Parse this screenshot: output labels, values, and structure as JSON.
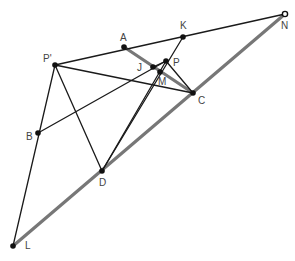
{
  "diagram": {
    "type": "geometry-construction",
    "colors": {
      "thin_line": "#1a1a1a",
      "thick_line": "#777777",
      "point": "#111111",
      "label": "#444444"
    },
    "points": [
      {
        "id": "A",
        "label": "A",
        "x": 124,
        "y": 47,
        "lx": 120,
        "ly": 41
      },
      {
        "id": "K",
        "label": "K",
        "x": 183,
        "y": 37,
        "lx": 180,
        "ly": 29
      },
      {
        "id": "N",
        "label": "N",
        "x": 285,
        "y": 14,
        "lx": 281,
        "ly": 29
      },
      {
        "id": "P'",
        "label": "P'",
        "x": 55,
        "y": 65,
        "lx": 43,
        "ly": 62
      },
      {
        "id": "J",
        "label": "J",
        "x": 153,
        "y": 67,
        "lx": 137,
        "ly": 71
      },
      {
        "id": "P",
        "label": "P",
        "x": 166,
        "y": 61,
        "lx": 173,
        "ly": 66
      },
      {
        "id": "M",
        "label": "M",
        "x": 160,
        "y": 72,
        "lx": 158,
        "ly": 85
      },
      {
        "id": "C",
        "label": "C",
        "x": 193,
        "y": 93,
        "lx": 198,
        "ly": 104
      },
      {
        "id": "B",
        "label": "B",
        "x": 38,
        "y": 133,
        "lx": 26,
        "ly": 140
      },
      {
        "id": "D",
        "label": "D",
        "x": 102,
        "y": 171,
        "lx": 99,
        "ly": 186
      },
      {
        "id": "L",
        "label": "L",
        "x": 13,
        "y": 246,
        "lx": 25,
        "ly": 249
      }
    ],
    "segments": [
      {
        "from": "L",
        "to": "N",
        "style": "thick"
      },
      {
        "from": "A",
        "to": "C",
        "style": "thick"
      },
      {
        "from": "P'",
        "to": "N",
        "style": "thin"
      },
      {
        "from": "P'",
        "to": "L",
        "style": "thin"
      },
      {
        "from": "P'",
        "to": "C",
        "style": "thin"
      },
      {
        "from": "P'",
        "to": "D",
        "style": "thin"
      },
      {
        "from": "B",
        "to": "P",
        "style": "thin"
      },
      {
        "from": "D",
        "to": "K",
        "style": "thin"
      },
      {
        "from": "D",
        "to": "P",
        "style": "thin"
      },
      {
        "from": "P",
        "to": "C",
        "style": "thin"
      },
      {
        "from": "J",
        "to": "P",
        "style": "thin"
      }
    ]
  }
}
